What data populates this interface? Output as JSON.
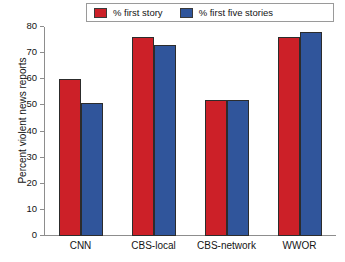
{
  "chart_data": {
    "type": "bar",
    "title": "",
    "xlabel": "",
    "ylabel": "Percent violent news reports",
    "categories": [
      "CNN",
      "CBS-local",
      "CBS-network",
      "WWOR"
    ],
    "series": [
      {
        "name": "% first story",
        "color": "#cc2028",
        "values": [
          60,
          76,
          52,
          76
        ]
      },
      {
        "name": "% first five stories",
        "color": "#30559b",
        "values": [
          51,
          73,
          52,
          78
        ]
      }
    ],
    "ylim": [
      0,
      80
    ],
    "yticks": [
      0,
      10,
      20,
      30,
      40,
      50,
      60,
      70,
      80
    ],
    "ytick_labels": [
      "0",
      "10",
      "20",
      "30",
      "40",
      "50",
      "60",
      "70",
      "80"
    ],
    "grid": false,
    "legend_position": "top",
    "legend_entries": [
      "% first story",
      "% first five stories"
    ]
  }
}
